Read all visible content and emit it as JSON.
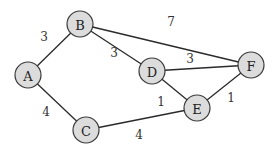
{
  "graph": {
    "nodes": [
      {
        "id": "A",
        "label": "A",
        "x": 28,
        "y": 75
      },
      {
        "id": "B",
        "label": "B",
        "x": 80,
        "y": 24
      },
      {
        "id": "C",
        "label": "C",
        "x": 86,
        "y": 130
      },
      {
        "id": "D",
        "label": "D",
        "x": 152,
        "y": 71
      },
      {
        "id": "E",
        "label": "E",
        "x": 197,
        "y": 108
      },
      {
        "id": "F",
        "label": "F",
        "x": 251,
        "y": 65
      }
    ],
    "edges": [
      {
        "from": "A",
        "to": "B",
        "weight": "3",
        "lx": 44,
        "ly": 37
      },
      {
        "from": "B",
        "to": "D",
        "weight": "3",
        "lx": 114,
        "ly": 53
      },
      {
        "from": "B",
        "to": "F",
        "weight": "7",
        "lx": 171,
        "ly": 22
      },
      {
        "from": "D",
        "to": "F",
        "weight": "3",
        "lx": 190,
        "ly": 59
      },
      {
        "from": "D",
        "to": "E",
        "weight": "1",
        "lx": 161,
        "ly": 102
      },
      {
        "from": "E",
        "to": "F",
        "weight": "1",
        "lx": 231,
        "ly": 98
      },
      {
        "from": "A",
        "to": "C",
        "weight": "4",
        "lx": 46,
        "ly": 112
      },
      {
        "from": "C",
        "to": "E",
        "weight": "4",
        "lx": 139,
        "ly": 135
      }
    ]
  }
}
